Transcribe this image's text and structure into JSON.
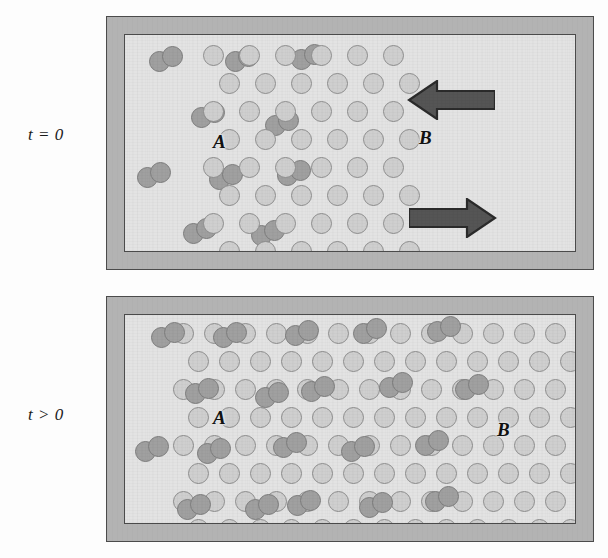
{
  "figure": {
    "background_color": "#fdfdfd",
    "width": 608,
    "height": 558
  },
  "colors": {
    "wall": "#b3b3b3",
    "wall_outline": "#4b4b4b",
    "chamber": "#e3e3e3",
    "species_a_fill": "#a0a0a0",
    "species_a_stroke": "#7d7d7d",
    "species_b_fill": "#cfcfcf",
    "species_b_stroke": "#8e8e8e",
    "arrow_fill": "#555555",
    "arrow_stroke": "#2b2b2b",
    "label_text": "#111111"
  },
  "panels": [
    {
      "id": "panel-initial",
      "time_label": "t = 0",
      "species_a_label": "A",
      "species_b_label": "B",
      "description": "Initial state: species A occupies the left half as a dilute gas of diatomic pairs; species B occupies the right half as an ordered close-packed lattice. Arrows indicate counter-diffusion across the interface.",
      "arrows": [
        {
          "name": "arrow-left",
          "direction": "left",
          "label": "B diffuses into A"
        },
        {
          "name": "arrow-right",
          "direction": "right",
          "label": "A diffuses into B"
        }
      ]
    },
    {
      "id": "panel-later",
      "time_label": "t > 0",
      "species_a_label": "A",
      "species_b_label": "B",
      "description": "Later state: the interface has broadened; A molecules have penetrated into the B lattice producing a mixed interdiffusion zone.",
      "arrows": []
    }
  ],
  "geometry": {
    "vessel_top": {
      "x": 106,
      "y": 16,
      "w": 488,
      "h": 254
    },
    "vessel_bottom": {
      "x": 106,
      "y": 296,
      "w": 488,
      "h": 246
    },
    "wall_thickness": 17,
    "atom_diameter": 21,
    "b_lattice_top": {
      "rows": 8,
      "cols": 6,
      "stagger": true
    },
    "b_lattice_bottom": {
      "rows": 8,
      "cols": 15,
      "stagger": true
    }
  },
  "lattice_top": {
    "origin_x": 78,
    "origin_y": 10,
    "dx": 36,
    "dy": 28,
    "stagger_offset": 16,
    "rows": 8,
    "cols": 6
  },
  "lattice_bottom": {
    "origin_x": 48,
    "origin_y": 8,
    "dx": 31,
    "dy": 28,
    "stagger_offset": 15,
    "rows": 8,
    "cols": 13
  },
  "molecules_top": [
    {
      "x": 24,
      "y": 16,
      "angle": -22
    },
    {
      "x": 100,
      "y": 16,
      "angle": -22
    },
    {
      "x": 166,
      "y": 14,
      "angle": -22
    },
    {
      "x": 66,
      "y": 72,
      "angle": -22
    },
    {
      "x": 140,
      "y": 80,
      "angle": -22
    },
    {
      "x": 12,
      "y": 132,
      "angle": -22
    },
    {
      "x": 84,
      "y": 134,
      "angle": -22
    },
    {
      "x": 152,
      "y": 130,
      "angle": -22
    },
    {
      "x": 58,
      "y": 188,
      "angle": -22
    },
    {
      "x": 126,
      "y": 190,
      "angle": -22
    }
  ],
  "molecules_bottom_left": [
    {
      "x": 26,
      "y": 12,
      "angle": -22
    },
    {
      "x": 88,
      "y": 12,
      "angle": -22
    },
    {
      "x": 60,
      "y": 68,
      "angle": -22
    },
    {
      "x": 130,
      "y": 72,
      "angle": -22
    },
    {
      "x": 10,
      "y": 126,
      "angle": -22
    },
    {
      "x": 72,
      "y": 128,
      "angle": -22
    },
    {
      "x": 52,
      "y": 184,
      "angle": -22
    },
    {
      "x": 120,
      "y": 184,
      "angle": -22
    }
  ],
  "molecules_bottom_mixed": [
    {
      "x": 160,
      "y": 10,
      "angle": -22
    },
    {
      "x": 228,
      "y": 8,
      "angle": -22
    },
    {
      "x": 302,
      "y": 6,
      "angle": -22
    },
    {
      "x": 176,
      "y": 66,
      "angle": -22
    },
    {
      "x": 254,
      "y": 62,
      "angle": -22
    },
    {
      "x": 330,
      "y": 64,
      "angle": -22
    },
    {
      "x": 148,
      "y": 122,
      "angle": -22
    },
    {
      "x": 216,
      "y": 126,
      "angle": -22
    },
    {
      "x": 290,
      "y": 120,
      "angle": -22
    },
    {
      "x": 162,
      "y": 180,
      "angle": -22
    },
    {
      "x": 234,
      "y": 182,
      "angle": -22
    },
    {
      "x": 300,
      "y": 176,
      "angle": -22
    }
  ],
  "labels": {
    "top_a": {
      "x": 88,
      "y": 96
    },
    "top_b": {
      "x": 294,
      "y": 92
    },
    "bottom_a": {
      "x": 88,
      "y": 92
    },
    "bottom_b": {
      "x": 372,
      "y": 104
    }
  }
}
